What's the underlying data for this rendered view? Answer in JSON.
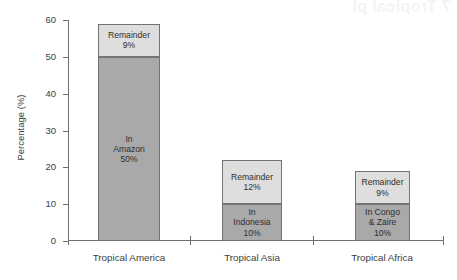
{
  "artifact": {
    "bleed_text": "7  Tropical pl"
  },
  "chart_data": {
    "type": "bar",
    "subtype": "stacked-bar",
    "title": "",
    "xlabel": "",
    "ylabel": "Percentage (%)",
    "ylim": [
      0,
      60
    ],
    "yticks": [
      0,
      10,
      20,
      30,
      40,
      50,
      60
    ],
    "ytick_labels": [
      "0",
      "10",
      "20",
      "30",
      "40",
      "50",
      "60"
    ],
    "grid": false,
    "legend": "none",
    "categories": [
      "Tropical America",
      "Tropical Asia",
      "Tropical Africa"
    ],
    "series": [
      {
        "name": "Core region",
        "color": "#a9a9a9",
        "values": [
          50,
          10,
          10
        ],
        "labels": [
          "In\nAmazon\n50%",
          "In\nIndonesia\n10%",
          "In Congo\n& Zaire\n10%"
        ]
      },
      {
        "name": "Remainder",
        "color": "#dedede",
        "values": [
          9,
          12,
          9
        ],
        "labels": [
          "Remainder\n9%",
          "Remainder\n12%",
          "Remainder\n9%"
        ]
      }
    ],
    "totals": [
      59,
      22,
      19
    ],
    "bars": [
      {
        "category": "Tropical America",
        "total": 59,
        "segments": [
          {
            "name": "remainder",
            "value": 9,
            "from": 50,
            "to": 59,
            "color": "#dedede",
            "label_lines": [
              "Remainder",
              "9%"
            ]
          },
          {
            "name": "in-amazon",
            "value": 50,
            "from": 0,
            "to": 50,
            "color": "#a9a9a9",
            "label_lines": [
              "In",
              "Amazon",
              "50%"
            ]
          }
        ]
      },
      {
        "category": "Tropical Asia",
        "total": 22,
        "segments": [
          {
            "name": "remainder",
            "value": 12,
            "from": 10,
            "to": 22,
            "color": "#dedede",
            "label_lines": [
              "Remainder",
              "12%"
            ]
          },
          {
            "name": "in-indonesia",
            "value": 10,
            "from": 0,
            "to": 10,
            "color": "#a9a9a9",
            "label_lines": [
              "In",
              "Indonesia",
              "10%"
            ]
          }
        ]
      },
      {
        "category": "Tropical Africa",
        "total": 19,
        "segments": [
          {
            "name": "remainder",
            "value": 9,
            "from": 10,
            "to": 19,
            "color": "#dedede",
            "label_lines": [
              "Remainder",
              "9%"
            ]
          },
          {
            "name": "in-congo-zaire",
            "value": 10,
            "from": 0,
            "to": 10,
            "color": "#a9a9a9",
            "label_lines": [
              "In Congo",
              "& Zaire",
              "10%"
            ]
          }
        ]
      }
    ],
    "colors": {
      "segment_top": "#dedede",
      "segment_bottom": "#a9a9a9",
      "segment_border": "#737373",
      "axis": "#6f6f6f",
      "text": "#3d3d3d",
      "background": "#ffffff"
    }
  }
}
